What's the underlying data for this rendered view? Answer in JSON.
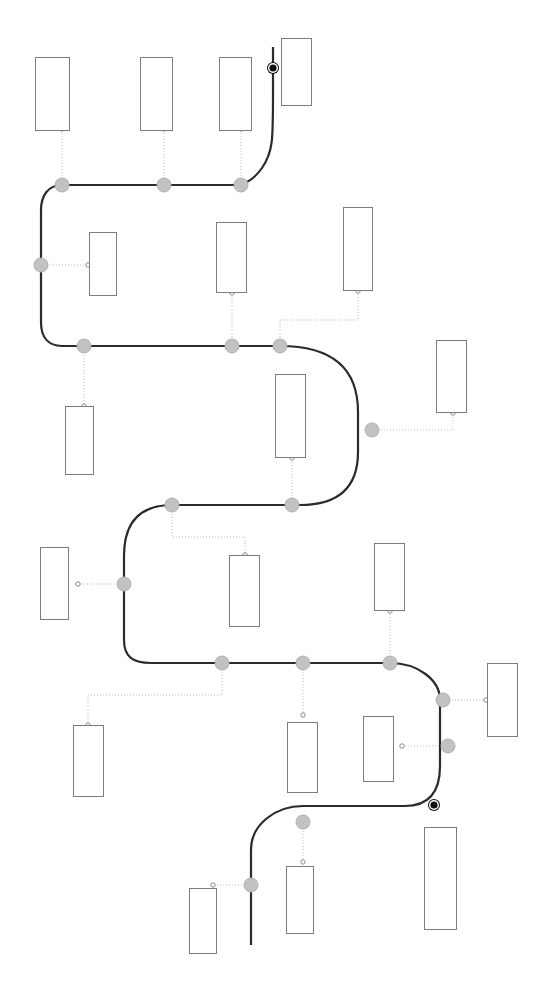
{
  "diagram": {
    "type": "serpentine-timeline",
    "title": "",
    "canvas": {
      "width": 545,
      "height": 981
    },
    "colors": {
      "background": "#ffffff",
      "path": "#2b2b2b",
      "node_fill": "#c2c2c2",
      "node_stroke": "#b0b0b0",
      "terminal_fill": "#111111",
      "terminal_ring": "#ffffff",
      "box_stroke": "#7c7c7c",
      "leader_line": "#a8a8a8",
      "leader_endpoint_stroke": "#6f6f6f"
    },
    "path_stroke_width": 2.2,
    "leader_stroke_width": 0.8,
    "leader_dash": "1,2",
    "node_radius": 7,
    "terminal_radius": 6,
    "endpoint_radius": 2.2,
    "main_path": "M 273 47 L 273 95 C 273 140 273 152 262 168 C 252 182 243 185 232 185 L 171 185 L 62 185 C 48 185 41 196 41 210 L 41 322 C 41 337 48 346 62 346 L 84 346 L 232 346 L 280 346 C 332 346 358 368 358 412 L 358 452 C 358 490 336 505 300 505 L 172 505 C 140 505 124 522 124 556 L 124 640 C 124 657 133 663 151 663 L 222 663 L 303 663 L 390 663 C 418 663 440 680 440 700 L 440 766 C 440 793 428 806 405 806 L 303 806 C 276 806 251 824 251 850 L 251 945",
    "leaders": [
      {
        "name": "leader-1",
        "d": "M 62 185 L 62 131",
        "endpoint": [
          62,
          129
        ]
      },
      {
        "name": "leader-2",
        "d": "M 164 185 L 164 131",
        "endpoint": [
          164,
          129
        ]
      },
      {
        "name": "leader-3",
        "d": "M 241 185 L 241 131",
        "endpoint": [
          241,
          129
        ]
      },
      {
        "name": "leader-4",
        "d": "M 41 265 L 86 265",
        "endpoint": [
          88,
          265
        ]
      },
      {
        "name": "leader-5",
        "d": "M 232 346 L 232 295",
        "endpoint": [
          232,
          293
        ]
      },
      {
        "name": "leader-6",
        "d": "M 280 346 L 280 320 L 358 320 L 358 293",
        "endpoint": [
          358,
          291
        ]
      },
      {
        "name": "leader-7",
        "d": "M 84 346 L 84 404",
        "endpoint": [
          84,
          406
        ]
      },
      {
        "name": "leader-8",
        "d": "M 372 430 L 453 430 L 453 415",
        "endpoint": [
          453,
          413
        ]
      },
      {
        "name": "leader-9",
        "d": "M 292 505 L 292 460",
        "endpoint": [
          292,
          458
        ]
      },
      {
        "name": "leader-10",
        "d": "M 172 505 L 172 537 L 245 537 L 245 553",
        "endpoint": [
          245,
          555
        ]
      },
      {
        "name": "leader-11",
        "d": "M 124 584 L 80 584",
        "endpoint": [
          78,
          584
        ]
      },
      {
        "name": "leader-12",
        "d": "M 222 663 L 222 695 L 88 695 L 88 723",
        "endpoint": [
          88,
          725
        ]
      },
      {
        "name": "leader-13",
        "d": "M 303 663 L 303 713",
        "endpoint": [
          303,
          715
        ]
      },
      {
        "name": "leader-14",
        "d": "M 390 663 L 390 613",
        "endpoint": [
          390,
          611
        ]
      },
      {
        "name": "leader-15",
        "d": "M 443 700 L 484 700",
        "endpoint": [
          486,
          700
        ]
      },
      {
        "name": "leader-16",
        "d": "M 448 746 L 404 746",
        "endpoint": [
          402,
          746
        ]
      },
      {
        "name": "leader-17",
        "d": "M 303 822 L 303 860",
        "endpoint": [
          303,
          862
        ]
      },
      {
        "name": "leader-18",
        "d": "M 251 885 L 215 885",
        "endpoint": [
          213,
          885
        ]
      }
    ],
    "nodes": [
      {
        "name": "milestone-node-1",
        "x": 62,
        "y": 185,
        "kind": "milestone"
      },
      {
        "name": "milestone-node-2",
        "x": 164,
        "y": 185,
        "kind": "milestone"
      },
      {
        "name": "milestone-node-3",
        "x": 241,
        "y": 185,
        "kind": "milestone"
      },
      {
        "name": "milestone-node-4",
        "x": 41,
        "y": 265,
        "kind": "milestone"
      },
      {
        "name": "milestone-node-5",
        "x": 84,
        "y": 346,
        "kind": "milestone"
      },
      {
        "name": "milestone-node-6",
        "x": 232,
        "y": 346,
        "kind": "milestone"
      },
      {
        "name": "milestone-node-7",
        "x": 280,
        "y": 346,
        "kind": "milestone"
      },
      {
        "name": "milestone-node-8",
        "x": 372,
        "y": 430,
        "kind": "milestone"
      },
      {
        "name": "milestone-node-9",
        "x": 292,
        "y": 505,
        "kind": "milestone"
      },
      {
        "name": "milestone-node-10",
        "x": 172,
        "y": 505,
        "kind": "milestone"
      },
      {
        "name": "milestone-node-11",
        "x": 124,
        "y": 584,
        "kind": "milestone"
      },
      {
        "name": "milestone-node-12",
        "x": 222,
        "y": 663,
        "kind": "milestone"
      },
      {
        "name": "milestone-node-13",
        "x": 303,
        "y": 663,
        "kind": "milestone"
      },
      {
        "name": "milestone-node-14",
        "x": 390,
        "y": 663,
        "kind": "milestone"
      },
      {
        "name": "milestone-node-15",
        "x": 443,
        "y": 700,
        "kind": "milestone"
      },
      {
        "name": "milestone-node-16",
        "x": 448,
        "y": 746,
        "kind": "milestone"
      },
      {
        "name": "milestone-node-17",
        "x": 303,
        "y": 822,
        "kind": "milestone"
      },
      {
        "name": "milestone-node-18",
        "x": 251,
        "y": 885,
        "kind": "milestone"
      }
    ],
    "terminals": [
      {
        "name": "start-terminal",
        "x": 273,
        "y": 68,
        "kind": "terminal"
      },
      {
        "name": "end-terminal",
        "x": 434,
        "y": 805,
        "kind": "terminal"
      }
    ],
    "label_boxes": [
      {
        "name": "label-box-1",
        "x": 35,
        "y": 57,
        "w": 35,
        "h": 74,
        "text": ""
      },
      {
        "name": "label-box-2",
        "x": 140,
        "y": 57,
        "w": 33,
        "h": 74,
        "text": ""
      },
      {
        "name": "label-box-3",
        "x": 219,
        "y": 57,
        "w": 33,
        "h": 74,
        "text": ""
      },
      {
        "name": "label-box-4",
        "x": 281,
        "y": 38,
        "w": 31,
        "h": 68,
        "text": ""
      },
      {
        "name": "label-box-5",
        "x": 89,
        "y": 232,
        "w": 28,
        "h": 64,
        "text": ""
      },
      {
        "name": "label-box-6",
        "x": 216,
        "y": 222,
        "w": 31,
        "h": 71,
        "text": ""
      },
      {
        "name": "label-box-7",
        "x": 343,
        "y": 207,
        "w": 30,
        "h": 84,
        "text": ""
      },
      {
        "name": "label-box-8",
        "x": 65,
        "y": 406,
        "w": 29,
        "h": 69,
        "text": ""
      },
      {
        "name": "label-box-9",
        "x": 436,
        "y": 340,
        "w": 31,
        "h": 73,
        "text": ""
      },
      {
        "name": "label-box-10",
        "x": 275,
        "y": 374,
        "w": 31,
        "h": 84,
        "text": ""
      },
      {
        "name": "label-box-11",
        "x": 40,
        "y": 547,
        "w": 29,
        "h": 73,
        "text": ""
      },
      {
        "name": "label-box-12",
        "x": 229,
        "y": 555,
        "w": 31,
        "h": 72,
        "text": ""
      },
      {
        "name": "label-box-13",
        "x": 374,
        "y": 543,
        "w": 31,
        "h": 68,
        "text": ""
      },
      {
        "name": "label-box-14",
        "x": 73,
        "y": 725,
        "w": 31,
        "h": 72,
        "text": ""
      },
      {
        "name": "label-box-15",
        "x": 287,
        "y": 722,
        "w": 31,
        "h": 71,
        "text": ""
      },
      {
        "name": "label-box-16",
        "x": 363,
        "y": 716,
        "w": 31,
        "h": 66,
        "text": ""
      },
      {
        "name": "label-box-17",
        "x": 487,
        "y": 663,
        "w": 31,
        "h": 74,
        "text": ""
      },
      {
        "name": "label-box-18",
        "x": 424,
        "y": 827,
        "w": 33,
        "h": 103,
        "text": ""
      },
      {
        "name": "label-box-19",
        "x": 286,
        "y": 866,
        "w": 28,
        "h": 68,
        "text": ""
      },
      {
        "name": "label-box-20",
        "x": 189,
        "y": 888,
        "w": 28,
        "h": 66,
        "text": ""
      }
    ]
  }
}
